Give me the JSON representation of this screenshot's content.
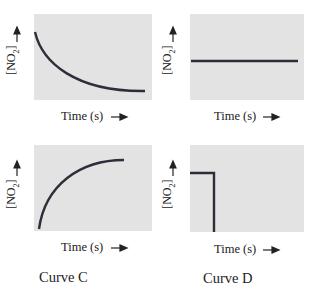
{
  "figure": {
    "panels": [
      {
        "id": "top-left",
        "ylabel": "[NO2] —▶",
        "xlabel": "Time (s) —▶",
        "shape": "exponential decay"
      },
      {
        "id": "top-right",
        "ylabel": "[NO2] —▶",
        "xlabel": "Time (s) —▶",
        "shape": "constant horizontal line"
      },
      {
        "id": "bottom-left",
        "ylabel": "[NO2] —▶",
        "xlabel": "Time (s) —▶",
        "shape": "exponential rise to plateau",
        "caption": "Curve C"
      },
      {
        "id": "bottom-right",
        "ylabel": "[NO2] —▶",
        "xlabel": "Time (s) —▶",
        "shape": "constant then sudden drop",
        "caption": "Curve D"
      }
    ],
    "ylabel_text": "[NO",
    "ylabel_sub": "2",
    "ylabel_close": "]",
    "xlabel_text": "Time (s)",
    "captions": {
      "c": "Curve C",
      "d": "Curve D"
    },
    "colors": {
      "panel": "#e3e3e3",
      "curve": "#2e2e3a"
    }
  }
}
